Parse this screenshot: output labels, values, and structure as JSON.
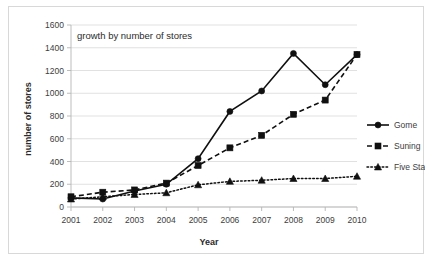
{
  "chart_data": {
    "type": "line",
    "title": "growth by number of stores",
    "xlabel": "Year",
    "ylabel": "number of stores",
    "categories": [
      "2001",
      "2002",
      "2003",
      "2004",
      "2005",
      "2006",
      "2007",
      "2008",
      "2009",
      "2010"
    ],
    "x": [
      2001,
      2002,
      2003,
      2004,
      2005,
      2006,
      2007,
      2008,
      2009,
      2010
    ],
    "ylim": [
      0,
      1600
    ],
    "xlim": [
      2001,
      2010
    ],
    "ytick_labels": [
      "0",
      "200",
      "400",
      "600",
      "800",
      "1000",
      "1200",
      "1400",
      "1600"
    ],
    "ytick_values": [
      0,
      200,
      400,
      600,
      800,
      1000,
      1200,
      1400,
      1600
    ],
    "grid": true,
    "legend_position": "right",
    "series": [
      {
        "name": "Gome",
        "marker": "circle",
        "linestyle": "solid",
        "color": "#101010",
        "values": [
          80,
          70,
          140,
          200,
          425,
          840,
          1020,
          1350,
          1075,
          1340
        ]
      },
      {
        "name": "Suning",
        "marker": "square",
        "linestyle": "dashed",
        "color": "#101010",
        "values": [
          90,
          130,
          150,
          210,
          365,
          520,
          630,
          815,
          940,
          1340
        ]
      },
      {
        "name": "Five Star",
        "marker": "triangle",
        "linestyle": "dotted",
        "color": "#101010",
        "values": [
          70,
          90,
          110,
          125,
          195,
          225,
          235,
          250,
          250,
          270
        ]
      }
    ]
  },
  "legend": {
    "items": [
      {
        "label": "Gome"
      },
      {
        "label": "Suning"
      },
      {
        "label": "Five Star"
      }
    ]
  }
}
